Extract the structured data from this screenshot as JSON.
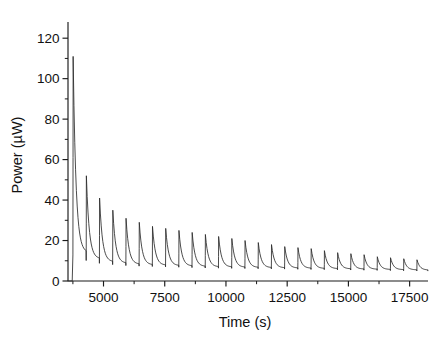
{
  "chart_data": {
    "type": "line",
    "title": "",
    "xlabel": "Time (s)",
    "ylabel": "Power (µW)",
    "xlim": [
      3550,
      18250
    ],
    "ylim": [
      0,
      128
    ],
    "grid": false,
    "legend": null,
    "x_ticks": [
      5000,
      7500,
      10000,
      12500,
      15000,
      17500
    ],
    "x_tick_labels": [
      "5000",
      "7500",
      "10000",
      "12500",
      "15000",
      "17500"
    ],
    "x_minor_step": 1250,
    "y_ticks": [
      0,
      20,
      40,
      60,
      80,
      100,
      120
    ],
    "y_tick_labels": [
      "0",
      "20",
      "40",
      "60",
      "80",
      "100",
      "120"
    ],
    "y_minor_step": 10,
    "series": [
      {
        "name": "Power",
        "peak_times": [
          3760,
          4300,
          4840,
          5380,
          5920,
          6460,
          7000,
          7540,
          8080,
          8620,
          9160,
          9700,
          10240,
          10780,
          11320,
          11860,
          12400,
          12940,
          13480,
          14020,
          14560,
          15100,
          15640,
          16180,
          16720,
          17260,
          17800
        ],
        "peak_values": [
          111,
          52,
          41,
          35,
          31,
          29,
          27,
          26,
          25,
          24,
          23,
          22,
          21,
          20,
          19,
          18,
          17,
          16.5,
          16,
          15,
          14,
          13.5,
          13,
          12,
          11.5,
          11,
          10.5
        ],
        "trough_values": [
          14,
          11,
          9.5,
          8.8,
          8.3,
          8.0,
          7.8,
          7.6,
          7.4,
          7.2,
          7.0,
          6.9,
          6.8,
          6.7,
          6.6,
          6.5,
          6.4,
          6.3,
          6.2,
          6.1,
          6.0,
          5.9,
          5.8,
          5.7,
          5.6,
          5.5,
          5.4
        ],
        "baseline_start": 0.0,
        "color": "#2b2b2b"
      }
    ]
  },
  "axis_labels": {
    "x_title": "Time (s)",
    "y_title": "Power (µW)"
  }
}
